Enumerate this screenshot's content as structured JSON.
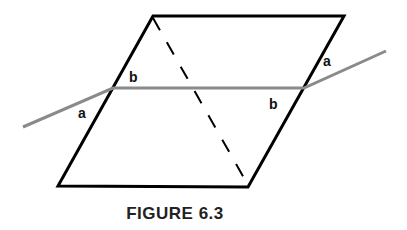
{
  "figure": {
    "caption": "FIGURE 6.3",
    "labels": {
      "left_upper": "b",
      "left_lower": "a",
      "right_upper": "a",
      "right_lower": "b"
    },
    "colors": {
      "plane_edge": "#000000",
      "transversal": "#8a8a8a",
      "dashed": "#000000"
    }
  }
}
